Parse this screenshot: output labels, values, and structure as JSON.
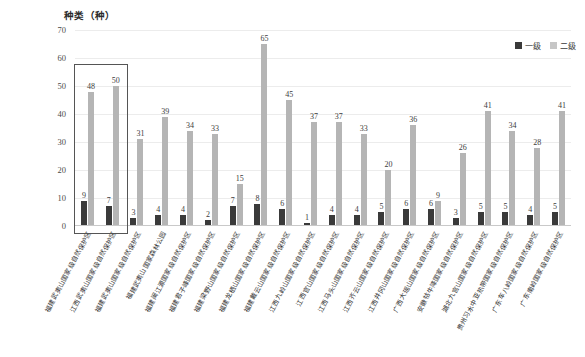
{
  "chart_data": {
    "type": "bar",
    "title": "",
    "ylabel": "种类（种）",
    "xlabel": "",
    "ylim": [
      0,
      70
    ],
    "ytick_labels": [
      "70",
      "60",
      "50",
      "40",
      "30",
      "20",
      "10",
      "0"
    ],
    "ytick_values": [
      70,
      60,
      50,
      40,
      30,
      20,
      10,
      0
    ],
    "grid": true,
    "legend_position": "top-right",
    "legend": [
      "一级",
      "二级"
    ],
    "categories": [
      "福建武夷山国家级自然保护区",
      "江西武夷山国家级自然保护区",
      "福建武夷山国家级自然保护区",
      "福建武夷山国家森林公园",
      "福建闽江源国家级自然保护区",
      "福建君子峰国家级自然保护区",
      "福建梁野山国家级自然保护区",
      "福建龙栖山国家级自然保护区",
      "福建戴云山国家级自然保护区",
      "江西九岭山国家级自然保护区",
      "江西官山国家级自然保护区",
      "江西马头山国家级自然保护区",
      "江西齐云山国家级自然保护区",
      "江西井冈山国家级自然保护区",
      "广西大瑶山国家级自然保护区",
      "安徽牯牛降国家级自然保护区",
      "湖北九宫山国家级自然保护区",
      "贵州习水中亚热带国家级自然保护区",
      "广东车八岭国家级自然保护区",
      "广东南岭国家级自然保护区"
    ],
    "series": [
      {
        "name": "一级",
        "color": "#3a3a3a",
        "values": [
          9,
          7,
          3,
          4,
          4,
          2,
          7,
          8,
          6,
          1,
          4,
          4,
          5,
          6,
          6,
          3,
          5,
          5,
          4,
          5
        ]
      },
      {
        "name": "二级",
        "color": "#b5b5b5",
        "values": [
          48,
          50,
          31,
          39,
          34,
          33,
          15,
          65,
          45,
          37,
          37,
          33,
          20,
          36,
          9,
          26,
          41,
          34,
          28,
          41
        ]
      }
    ],
    "annotations": [
      {
        "type": "highlight-rectangle",
        "covers_categories": [
          0,
          1
        ],
        "note": "矩形框标注前两个保护区"
      }
    ]
  }
}
